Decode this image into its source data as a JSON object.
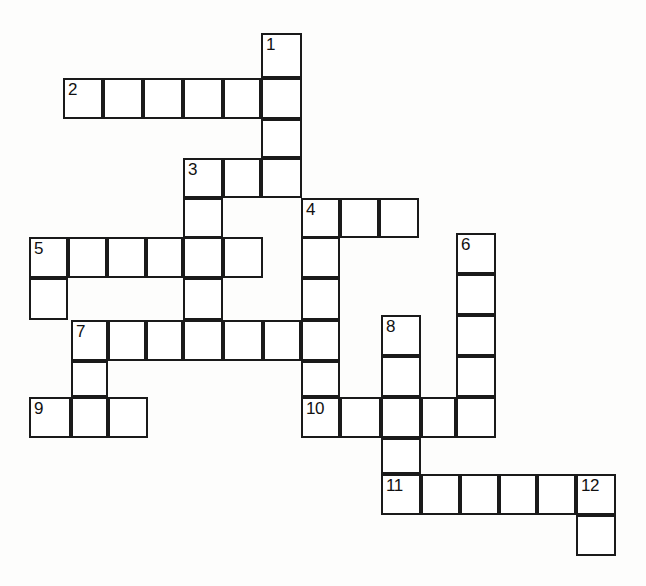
{
  "document": {
    "type": "crossword-puzzle-grid",
    "title": "Crossword Puzzle Grid",
    "background_color": "#fdfdfc",
    "cell_fill_color": "#ffffff",
    "cell_border_color": "#1a1a1a",
    "number_color": "#111111",
    "cell_size": 39,
    "row_height": 41,
    "border_width": 2,
    "total_numbered_clues": 12,
    "total_cells": 62
  },
  "grid": {
    "columns": [
      29,
      68,
      107,
      146,
      185,
      224,
      263,
      302,
      341,
      380,
      419,
      458,
      497,
      536,
      575,
      614
    ],
    "rows": [
      33,
      74,
      115,
      156,
      197,
      238,
      279,
      320,
      361,
      402,
      443,
      484,
      525
    ],
    "cells": [
      {
        "x": 261,
        "y": 33,
        "w": 41,
        "h": 45,
        "number": "1"
      },
      {
        "x": 261,
        "y": 78,
        "w": 41,
        "h": 41,
        "number": ""
      },
      {
        "x": 63,
        "y": 78,
        "w": 40,
        "h": 41,
        "number": "2"
      },
      {
        "x": 103,
        "y": 78,
        "w": 40,
        "h": 41,
        "number": ""
      },
      {
        "x": 143,
        "y": 78,
        "w": 40,
        "h": 41,
        "number": ""
      },
      {
        "x": 183,
        "y": 78,
        "w": 40,
        "h": 41,
        "number": ""
      },
      {
        "x": 223,
        "y": 78,
        "w": 38,
        "h": 41,
        "number": ""
      },
      {
        "x": 261,
        "y": 119,
        "w": 41,
        "h": 39,
        "number": ""
      },
      {
        "x": 183,
        "y": 158,
        "w": 40,
        "h": 40,
        "number": "3"
      },
      {
        "x": 223,
        "y": 158,
        "w": 38,
        "h": 40,
        "number": ""
      },
      {
        "x": 261,
        "y": 158,
        "w": 41,
        "h": 40,
        "number": ""
      },
      {
        "x": 183,
        "y": 198,
        "w": 40,
        "h": 40,
        "number": ""
      },
      {
        "x": 301,
        "y": 198,
        "w": 39,
        "h": 40,
        "number": "4"
      },
      {
        "x": 340,
        "y": 198,
        "w": 39,
        "h": 40,
        "number": ""
      },
      {
        "x": 379,
        "y": 198,
        "w": 40,
        "h": 40,
        "number": ""
      },
      {
        "x": 29,
        "y": 237,
        "w": 39,
        "h": 41,
        "number": "5"
      },
      {
        "x": 68,
        "y": 237,
        "w": 39,
        "h": 41,
        "number": ""
      },
      {
        "x": 107,
        "y": 237,
        "w": 39,
        "h": 41,
        "number": ""
      },
      {
        "x": 146,
        "y": 237,
        "w": 37,
        "h": 41,
        "number": ""
      },
      {
        "x": 183,
        "y": 237,
        "w": 40,
        "h": 41,
        "number": ""
      },
      {
        "x": 223,
        "y": 237,
        "w": 40,
        "h": 41,
        "number": ""
      },
      {
        "x": 301,
        "y": 237,
        "w": 39,
        "h": 41,
        "number": ""
      },
      {
        "x": 456,
        "y": 233,
        "w": 40,
        "h": 41,
        "number": "6"
      },
      {
        "x": 29,
        "y": 278,
        "w": 39,
        "h": 42,
        "number": ""
      },
      {
        "x": 183,
        "y": 278,
        "w": 40,
        "h": 42,
        "number": ""
      },
      {
        "x": 301,
        "y": 278,
        "w": 39,
        "h": 42,
        "number": ""
      },
      {
        "x": 456,
        "y": 274,
        "w": 40,
        "h": 41,
        "number": ""
      },
      {
        "x": 71,
        "y": 320,
        "w": 37,
        "h": 41,
        "number": "7"
      },
      {
        "x": 108,
        "y": 320,
        "w": 38,
        "h": 41,
        "number": ""
      },
      {
        "x": 146,
        "y": 320,
        "w": 37,
        "h": 41,
        "number": ""
      },
      {
        "x": 183,
        "y": 320,
        "w": 40,
        "h": 41,
        "number": ""
      },
      {
        "x": 223,
        "y": 320,
        "w": 40,
        "h": 41,
        "number": ""
      },
      {
        "x": 263,
        "y": 320,
        "w": 38,
        "h": 41,
        "number": ""
      },
      {
        "x": 301,
        "y": 320,
        "w": 39,
        "h": 41,
        "number": ""
      },
      {
        "x": 381,
        "y": 315,
        "w": 40,
        "h": 41,
        "number": "8"
      },
      {
        "x": 456,
        "y": 315,
        "w": 40,
        "h": 41,
        "number": ""
      },
      {
        "x": 71,
        "y": 361,
        "w": 37,
        "h": 36,
        "number": ""
      },
      {
        "x": 301,
        "y": 361,
        "w": 39,
        "h": 36,
        "number": ""
      },
      {
        "x": 381,
        "y": 356,
        "w": 40,
        "h": 41,
        "number": ""
      },
      {
        "x": 456,
        "y": 356,
        "w": 40,
        "h": 41,
        "number": ""
      },
      {
        "x": 29,
        "y": 397,
        "w": 42,
        "h": 41,
        "number": "9"
      },
      {
        "x": 71,
        "y": 397,
        "w": 37,
        "h": 41,
        "number": ""
      },
      {
        "x": 108,
        "y": 397,
        "w": 40,
        "h": 41,
        "number": ""
      },
      {
        "x": 301,
        "y": 397,
        "w": 39,
        "h": 41,
        "number": "10"
      },
      {
        "x": 340,
        "y": 397,
        "w": 41,
        "h": 41,
        "number": ""
      },
      {
        "x": 381,
        "y": 397,
        "w": 40,
        "h": 41,
        "number": ""
      },
      {
        "x": 421,
        "y": 397,
        "w": 35,
        "h": 41,
        "number": ""
      },
      {
        "x": 456,
        "y": 397,
        "w": 40,
        "h": 41,
        "number": ""
      },
      {
        "x": 381,
        "y": 438,
        "w": 40,
        "h": 36,
        "number": ""
      },
      {
        "x": 381,
        "y": 474,
        "w": 40,
        "h": 41,
        "number": "11"
      },
      {
        "x": 421,
        "y": 474,
        "w": 39,
        "h": 41,
        "number": ""
      },
      {
        "x": 460,
        "y": 474,
        "w": 39,
        "h": 41,
        "number": ""
      },
      {
        "x": 499,
        "y": 474,
        "w": 38,
        "h": 41,
        "number": ""
      },
      {
        "x": 537,
        "y": 474,
        "w": 39,
        "h": 41,
        "number": ""
      },
      {
        "x": 576,
        "y": 474,
        "w": 40,
        "h": 41,
        "number": "12"
      },
      {
        "x": 576,
        "y": 515,
        "w": 40,
        "h": 41,
        "number": ""
      }
    ]
  },
  "clue_numbers": [
    "1",
    "2",
    "3",
    "4",
    "5",
    "6",
    "7",
    "8",
    "9",
    "10",
    "11",
    "12"
  ]
}
